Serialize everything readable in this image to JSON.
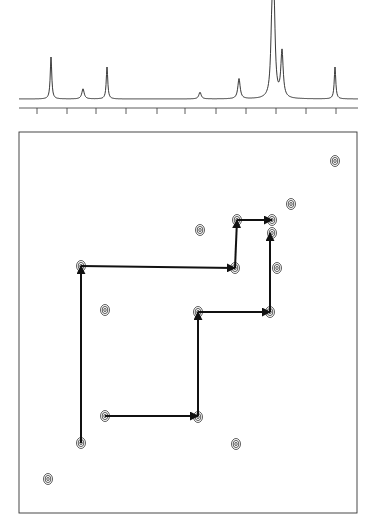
{
  "chart_data": {
    "type": "scatter",
    "title": "",
    "subtitle": "2D COSY NMR spectrum with 1D 1H projection and connectivity walk",
    "xlabel": "",
    "ylabel": "",
    "tick_labels_visible": false,
    "grid": false,
    "legend": "none",
    "projection_1d": {
      "x_ticks_px": [
        37,
        67,
        96,
        126,
        157,
        185,
        216,
        246,
        276,
        306,
        336
      ],
      "peaks": [
        {
          "x": 51,
          "height": 0.5,
          "shape": "singlet"
        },
        {
          "x": 83,
          "height": 0.12,
          "shape": "multiplet"
        },
        {
          "x": 107,
          "height": 0.38,
          "shape": "singlet"
        },
        {
          "x": 200,
          "height": 0.08,
          "shape": "multiplet"
        },
        {
          "x": 239,
          "height": 0.24,
          "shape": "multiplet"
        },
        {
          "x": 272,
          "height": 0.85,
          "shape": "multiplet"
        },
        {
          "x": 274,
          "height": 1.0,
          "shape": "multiplet"
        },
        {
          "x": 282,
          "height": 0.55,
          "shape": "multiplet"
        },
        {
          "x": 335,
          "height": 0.38,
          "shape": "singlet"
        }
      ]
    },
    "cross_peaks": [
      {
        "x": 335,
        "y": 161
      },
      {
        "x": 291,
        "y": 204
      },
      {
        "x": 272,
        "y": 220
      },
      {
        "x": 237,
        "y": 220
      },
      {
        "x": 200,
        "y": 230
      },
      {
        "x": 272,
        "y": 233
      },
      {
        "x": 277,
        "y": 268
      },
      {
        "x": 235,
        "y": 268
      },
      {
        "x": 81,
        "y": 266
      },
      {
        "x": 105,
        "y": 310
      },
      {
        "x": 198,
        "y": 312
      },
      {
        "x": 270,
        "y": 312
      },
      {
        "x": 105,
        "y": 416
      },
      {
        "x": 198,
        "y": 417
      },
      {
        "x": 81,
        "y": 443
      },
      {
        "x": 236,
        "y": 444
      },
      {
        "x": 48,
        "y": 479
      }
    ],
    "connectivity_paths": [
      {
        "name": "walk-1",
        "points": [
          [
            81,
            443
          ],
          [
            81,
            266
          ],
          [
            235,
            268
          ],
          [
            237,
            220
          ],
          [
            272,
            220
          ]
        ]
      },
      {
        "name": "walk-2",
        "points": [
          [
            105,
            416
          ],
          [
            198,
            416
          ],
          [
            198,
            312
          ],
          [
            270,
            312
          ],
          [
            270,
            233
          ]
        ]
      }
    ],
    "plot_frame": {
      "x0": 19,
      "y0": 132,
      "x1": 357,
      "y1": 513
    }
  }
}
